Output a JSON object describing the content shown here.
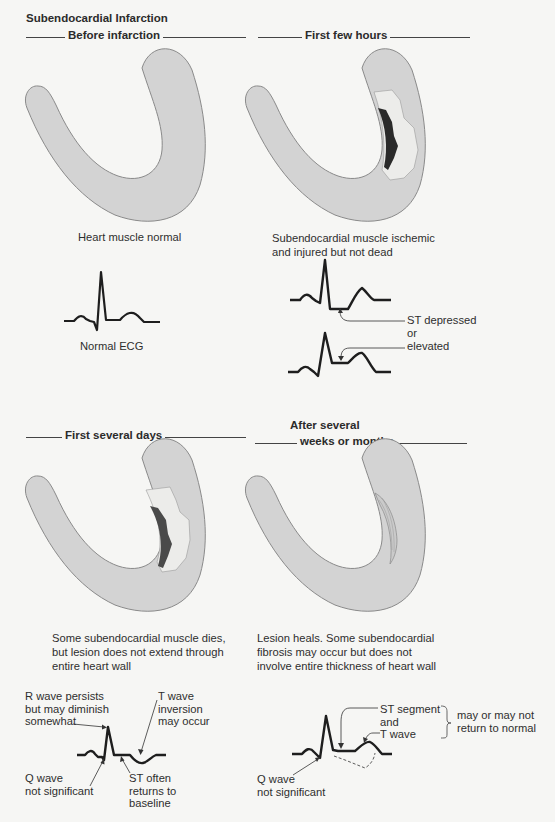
{
  "title": "Subendocardial Infarction",
  "panels": [
    {
      "id": "before-infarction",
      "heading": "Before infarction",
      "caption": [
        "Heart muscle normal"
      ],
      "ecg_label": "Normal ECG"
    },
    {
      "id": "first-few-hours",
      "heading": "First few hours",
      "caption": [
        "Subendocardial muscle ischemic",
        "and injured but not dead"
      ],
      "annotations": [
        "ST depressed",
        "or",
        "elevated"
      ]
    },
    {
      "id": "first-several-days",
      "heading": "First several days",
      "caption": [
        "Some subendocardial muscle dies,",
        "but lesion does not extend through",
        "entire heart wall"
      ],
      "annotations": {
        "r_wave": [
          "R wave persists",
          "but may diminish",
          "somewhat"
        ],
        "t_wave": [
          "T wave",
          "inversion",
          "may occur"
        ],
        "q_wave": [
          "Q wave",
          "not significant"
        ],
        "st": [
          "ST often",
          "returns to",
          "baseline"
        ]
      }
    },
    {
      "id": "after-several-weeks",
      "heading": [
        "After several",
        "weeks or months"
      ],
      "caption": [
        "Lesion heals. Some subendocardial",
        "fibrosis may occur but does not",
        "involve entire thickness of heart wall"
      ],
      "annotations": {
        "st_t": [
          "ST segment",
          "and",
          "T wave"
        ],
        "brace_note": [
          "may or may not",
          "return to normal"
        ],
        "q_wave": [
          "Q wave",
          "not significant"
        ]
      }
    }
  ],
  "colors": {
    "background": "#f6f6f4",
    "muscle": "#d3d3d3",
    "muscle_outline": "#8a8a8a",
    "injured_zone": "#ececea",
    "necrotic_zone": "#2a2a2a",
    "necrotic_zone_days": "#4a4a4a",
    "ecg_line": "#1e1e1e"
  }
}
